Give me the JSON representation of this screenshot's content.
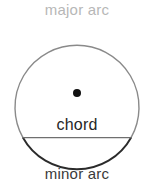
{
  "figure": {
    "background_color": "#ffffff",
    "labels": {
      "major_arc": "major arc",
      "chord": "chord",
      "minor_arc": "minor arc"
    },
    "colors": {
      "major_arc_text": "#b7b7b7",
      "chord_text": "#262626",
      "minor_arc_text": "#3a3a3a",
      "major_arc_stroke": "#8a8a8a",
      "minor_arc_stroke": "#2b2b2b",
      "chord_stroke": "#6f6f6f",
      "center_dot": "#111111"
    },
    "geometry": {
      "center_x": 77,
      "center_y": 93,
      "radius": 62,
      "chord_y": 138,
      "center_dot_radius": 4
    }
  }
}
